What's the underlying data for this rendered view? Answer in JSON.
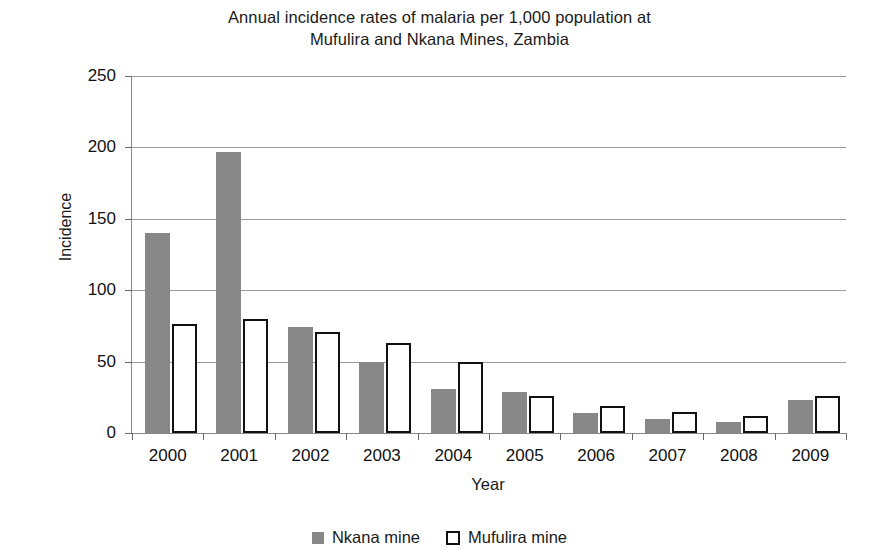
{
  "chart_data": {
    "type": "bar",
    "title": "Annual incidence rates of malaria per 1,000 population at Mufulira and Nkana Mines, Zambia",
    "title_lines": [
      "Annual incidence rates of malaria per 1,000 population at",
      "Mufulira and Nkana Mines, Zambia"
    ],
    "xlabel": "Year",
    "ylabel": "Incidence",
    "categories": [
      "2000",
      "2001",
      "2002",
      "2003",
      "2004",
      "2005",
      "2006",
      "2007",
      "2008",
      "2009"
    ],
    "series": [
      {
        "name": "Nkana mine",
        "color": "#878787",
        "style": "filled",
        "values": [
          140,
          197,
          74,
          50,
          31,
          29,
          14,
          10,
          8,
          23
        ]
      },
      {
        "name": "Mufulira mine",
        "color": "#ffffff",
        "border_color": "#111111",
        "style": "outlined",
        "values": [
          76,
          80,
          71,
          63,
          50,
          26,
          19,
          15,
          12,
          26
        ]
      }
    ],
    "ylim": [
      0,
      250
    ],
    "yticks": [
      0,
      50,
      100,
      150,
      200,
      250
    ],
    "ytick_labels": [
      "0",
      "50",
      "100",
      "150",
      "200",
      "250"
    ],
    "grid": true,
    "grid_axis": "y",
    "legend_position": "bottom"
  },
  "legend": {
    "items": [
      {
        "label": "Nkana mine",
        "swatch": "filled-gray-square-icon"
      },
      {
        "label": "Mufulira mine",
        "swatch": "outlined-white-square-icon"
      }
    ]
  }
}
